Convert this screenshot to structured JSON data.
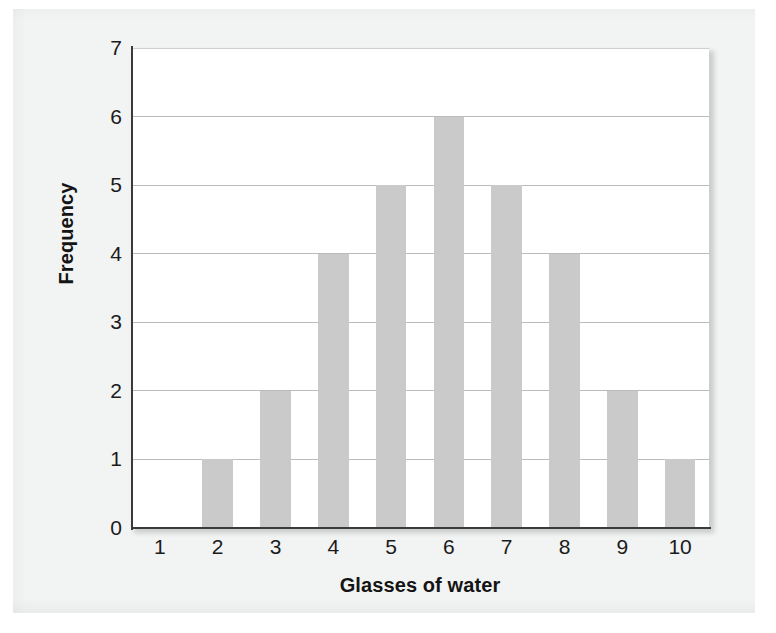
{
  "chart_data": {
    "type": "bar",
    "title": "",
    "xlabel": "Glasses of water",
    "ylabel": "Frequency",
    "categories": [
      "1",
      "2",
      "3",
      "4",
      "5",
      "6",
      "7",
      "8",
      "9",
      "10"
    ],
    "values": [
      0,
      1,
      2,
      4,
      5,
      6,
      5,
      4,
      2,
      1
    ],
    "ylim": [
      0,
      7
    ],
    "yticks": [
      "0",
      "1",
      "2",
      "3",
      "4",
      "5",
      "6",
      "7"
    ],
    "ytick_values": [
      0,
      1,
      2,
      3,
      4,
      5,
      6,
      7
    ],
    "grid": "horizontal",
    "legend": "none",
    "bar_color": "#cacaca",
    "gridline_color": "#b9bcbd",
    "axis_color": "#3a3a3a",
    "plot_background": "#ffffff",
    "page_background": "#f2f3f3"
  }
}
